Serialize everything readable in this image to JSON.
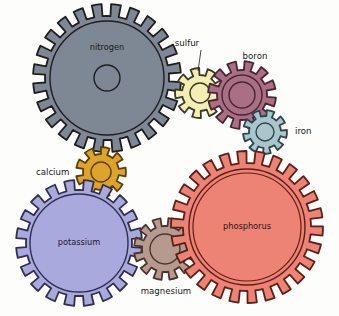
{
  "figure": {
    "kind": "gear-train-diagram",
    "title": "",
    "background_color": "#fdfdfc",
    "outline_color": "#1a1a1a"
  },
  "gears": [
    {
      "id": "nitrogen",
      "label": "nitrogen",
      "label_kind": "inside",
      "fill": "#7e8794",
      "stroke": "#1e1e1e",
      "cx": 107,
      "cy": 78,
      "outer_r": 74,
      "root_r": 62,
      "rim_r": 57,
      "hub_r": 13,
      "teeth": 24,
      "phase": 7,
      "label_x": 107,
      "label_y": 50
    },
    {
      "id": "sulfur",
      "label": "sulfur",
      "label_kind": "callout",
      "fill": "#f2eeb4",
      "stroke": "#3c3a24",
      "cx": 200,
      "cy": 93,
      "outer_r": 25,
      "root_r": 18,
      "rim_r": 0,
      "hub_r": 10,
      "teeth": 9,
      "phase": 18,
      "label_x": 187,
      "label_y": 46,
      "leader": {
        "x1": 201,
        "y1": 50,
        "x2": 198,
        "y2": 71
      }
    },
    {
      "id": "boron",
      "label": "boron",
      "label_kind": "callout",
      "fill": "#a96f84",
      "stroke": "#4a2433",
      "cx": 242,
      "cy": 95,
      "outer_r": 34,
      "root_r": 25,
      "rim_r": 20,
      "hub_r": 13,
      "teeth": 12,
      "phase": 12,
      "label_x": 255,
      "label_y": 59
    },
    {
      "id": "iron",
      "label": "iron",
      "label_kind": "callout",
      "fill": "#a8c6cb",
      "stroke": "#2f4549",
      "cx": 265,
      "cy": 132,
      "outer_r": 22,
      "root_r": 16,
      "rim_r": 0,
      "hub_r": 9,
      "teeth": 9,
      "phase": 5,
      "label_x": 295,
      "label_y": 134
    },
    {
      "id": "calcium",
      "label": "calcium",
      "label_kind": "callout",
      "fill": "#dda42c",
      "stroke": "#5a3f0d",
      "cx": 101,
      "cy": 172,
      "outer_r": 25,
      "root_r": 18,
      "rim_r": 0,
      "hub_r": 10,
      "teeth": 9,
      "phase": 0,
      "label_x": 36,
      "label_y": 175
    },
    {
      "id": "potassium",
      "label": "potassium",
      "label_kind": "inside",
      "fill": "#a9a9de",
      "stroke": "#30304e",
      "cx": 79,
      "cy": 243,
      "outer_r": 63,
      "root_r": 53,
      "rim_r": 49,
      "hub_r": 0,
      "teeth": 20,
      "phase": 9,
      "label_x": 79,
      "label_y": 245
    },
    {
      "id": "magnesium",
      "label": "magnesium",
      "label_kind": "callout",
      "fill": "#b69a90",
      "stroke": "#4a352d",
      "cx": 165,
      "cy": 249,
      "outer_r": 31,
      "root_r": 23,
      "rim_r": 0,
      "hub_r": 15,
      "teeth": 12,
      "phase": 14,
      "label_x": 166,
      "label_y": 294
    },
    {
      "id": "phosphorus",
      "label": "phosphorus",
      "label_kind": "inside",
      "fill": "#ec8374",
      "stroke": "#5d1f18",
      "cx": 247,
      "cy": 227,
      "outer_r": 76,
      "root_r": 64,
      "rim_r": 58,
      "hub_r": 0,
      "teeth": 26,
      "phase": 3,
      "label_x": 247,
      "label_y": 229,
      "second_rim_r": 54
    }
  ],
  "legend": {
    "nitrogen": "nitrogen",
    "sulfur": "sulfur",
    "boron": "boron",
    "iron": "iron",
    "calcium": "calcium",
    "potassium": "potassium",
    "magnesium": "magnesium",
    "phosphorus": "phosphorus"
  }
}
